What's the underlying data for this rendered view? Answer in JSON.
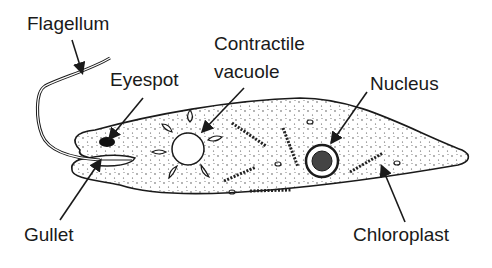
{
  "diagram": {
    "labels": {
      "flagellum": "Flagellum",
      "eyespot": "Eyespot",
      "contractile_vacuole_line1": "Contractile",
      "contractile_vacuole_line2": "vacuole",
      "nucleus": "Nucleus",
      "gullet": "Gullet",
      "chloroplast": "Chloroplast"
    },
    "colors": {
      "ink": "#1a1a1a",
      "background": "#ffffff"
    }
  }
}
